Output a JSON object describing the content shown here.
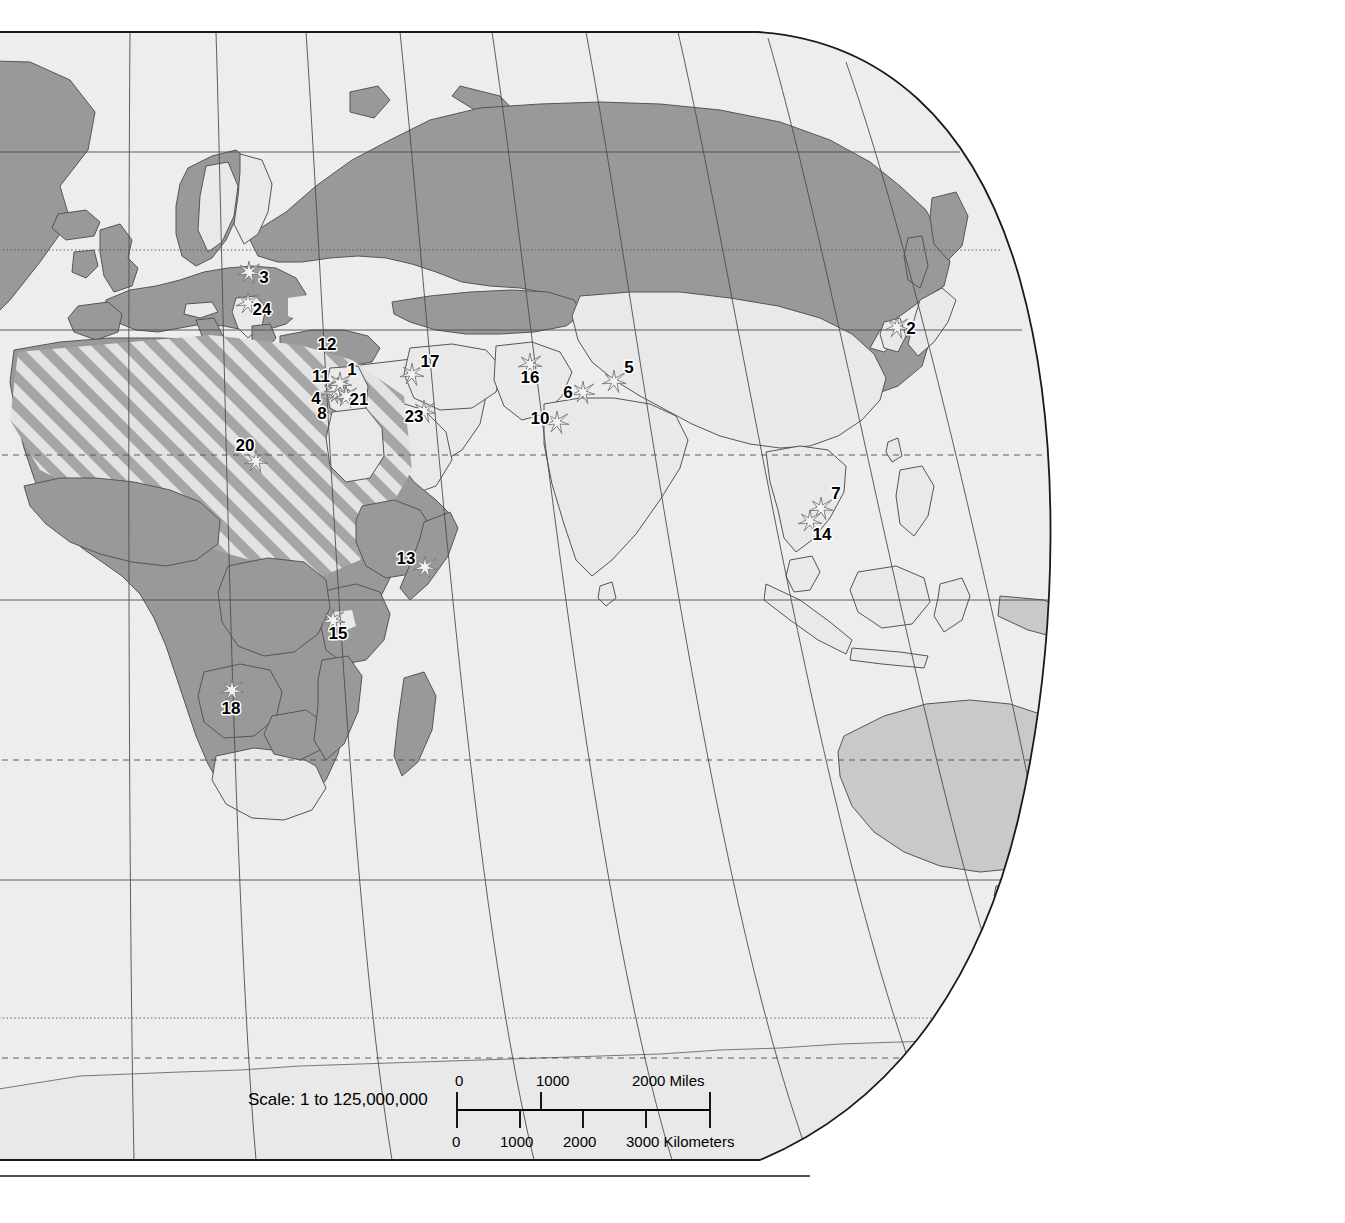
{
  "map": {
    "title": "World Map - Eastern Hemisphere",
    "projection": "elliptical-robinson",
    "legend_note": "",
    "colors": {
      "ocean": "#ededed",
      "land_light": "#e9e9e9",
      "land_medium": "#c9c9c9",
      "land_dark": "#999999",
      "hatch_gray": "#a6a6a6",
      "hatch_light": "#e3e3e3",
      "border": "#555555",
      "frame": "#1a1a1a",
      "graticule": "#4d4d4d",
      "marker_fill": "#f2f2f2",
      "marker_stroke": "#777777",
      "label_text": "#000000"
    },
    "scale": {
      "label": "Scale:  1 to 125,000,000",
      "miles_ticks": [
        "0",
        "1000",
        "2000 Miles"
      ],
      "km_ticks": [
        "0",
        "1000",
        "2000",
        "3000 Kilometers"
      ]
    },
    "markers": [
      {
        "id": "1",
        "label": "1",
        "x": 352,
        "y": 375,
        "mx": 338,
        "my": 388
      },
      {
        "id": "2",
        "label": "2",
        "x": 911,
        "y": 334,
        "mx": 897,
        "my": 327
      },
      {
        "id": "3",
        "label": "3",
        "x": 264,
        "y": 283,
        "mx": 249,
        "my": 272
      },
      {
        "id": "4",
        "label": "4",
        "x": 316,
        "y": 404,
        "mx": 333,
        "my": 392
      },
      {
        "id": "5",
        "label": "5",
        "x": 629,
        "y": 373,
        "mx": 614,
        "my": 381
      },
      {
        "id": "6",
        "label": "6",
        "x": 568,
        "y": 398,
        "mx": 583,
        "my": 392
      },
      {
        "id": "7",
        "label": "7",
        "x": 836,
        "y": 499,
        "mx": 821,
        "my": 508
      },
      {
        "id": "8",
        "label": "8",
        "x": 322,
        "y": 419,
        "mx": 337,
        "my": 392
      },
      {
        "id": "10",
        "label": "10",
        "x": 540,
        "y": 424,
        "mx": 557,
        "my": 422
      },
      {
        "id": "11",
        "label": "11",
        "x": 321,
        "y": 382,
        "mx": 336,
        "my": 389
      },
      {
        "id": "12",
        "label": "12",
        "x": 327,
        "y": 350,
        "mx": 340,
        "my": 383
      },
      {
        "id": "13",
        "label": "13",
        "x": 406,
        "y": 564,
        "mx": 425,
        "my": 567
      },
      {
        "id": "14",
        "label": "14",
        "x": 822,
        "y": 540,
        "mx": 810,
        "my": 521
      },
      {
        "id": "15",
        "label": "15",
        "x": 338,
        "y": 639,
        "mx": 333,
        "my": 620
      },
      {
        "id": "16",
        "label": "16",
        "x": 530,
        "y": 383,
        "mx": 530,
        "my": 364
      },
      {
        "id": "17",
        "label": "17",
        "x": 430,
        "y": 367,
        "mx": 412,
        "my": 374
      },
      {
        "id": "18",
        "label": "18",
        "x": 231,
        "y": 714,
        "mx": 232,
        "my": 690
      },
      {
        "id": "20",
        "label": "20",
        "x": 245,
        "y": 451,
        "mx": 256,
        "my": 461
      },
      {
        "id": "21",
        "label": "21",
        "x": 359,
        "y": 405,
        "mx": 346,
        "my": 396
      },
      {
        "id": "23",
        "label": "23",
        "x": 414,
        "y": 422,
        "mx": 424,
        "my": 411
      },
      {
        "id": "24",
        "label": "24",
        "x": 262,
        "y": 315,
        "mx": 248,
        "my": 303
      }
    ]
  }
}
